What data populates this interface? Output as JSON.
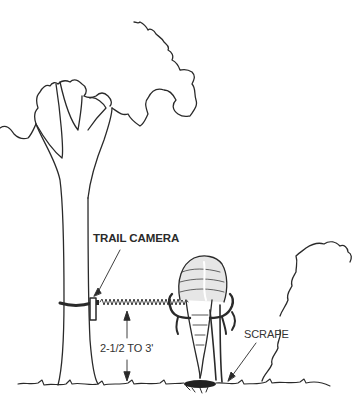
{
  "figure": {
    "labels": {
      "camera": "TRAIL CAMERA",
      "height": "2-1/2 TO 3'",
      "scrape": "SCRAPE"
    },
    "colors": {
      "ink": "#2a2a2a",
      "background": "#ffffff"
    }
  }
}
